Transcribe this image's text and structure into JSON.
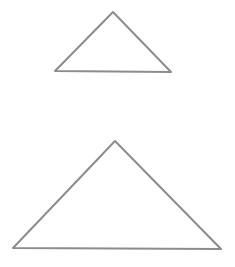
{
  "canvas": {
    "width": 235,
    "height": 267,
    "background": "#ffffff"
  },
  "style": {
    "stroke": "#8c8c8c",
    "stroke_width": 2
  },
  "shapes": [
    {
      "name": "small-triangle",
      "points": [
        [
          113,
          12
        ],
        [
          171,
          72
        ],
        [
          55,
          71
        ]
      ]
    },
    {
      "name": "large-triangle",
      "points": [
        [
          115,
          141
        ],
        [
          221,
          249
        ],
        [
          13,
          248
        ]
      ]
    }
  ]
}
